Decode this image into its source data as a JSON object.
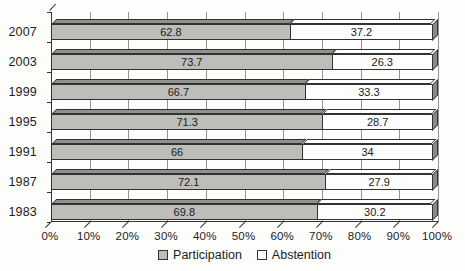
{
  "chart_data": {
    "type": "bar",
    "orientation": "horizontal",
    "stacked": true,
    "grid": "vertical",
    "legend_position": "bottom",
    "title": "",
    "xlabel": "",
    "ylabel": "",
    "xlim": [
      0,
      100
    ],
    "categories": [
      "2007",
      "2003",
      "1999",
      "1995",
      "1991",
      "1987",
      "1983"
    ],
    "series": [
      {
        "name": "Participation",
        "values": [
          62.8,
          73.7,
          66.7,
          71.3,
          66,
          72.1,
          69.8
        ],
        "labels": [
          "62.8",
          "73.7",
          "66.7",
          "71.3",
          "66",
          "72.1",
          "69.8"
        ],
        "color": "#bdbeba",
        "top_face_color": "#90918d"
      },
      {
        "name": "Abstention",
        "values": [
          37.2,
          26.3,
          33.3,
          28.7,
          34,
          27.9,
          30.2
        ],
        "labels": [
          "37.2",
          "26.3",
          "33.3",
          "28.7",
          "34",
          "27.9",
          "30.2"
        ],
        "color": "#fdfdfd",
        "top_face_color": "#fdfdfd"
      }
    ],
    "x_ticks": [
      "0%",
      "10%",
      "20%",
      "30%",
      "40%",
      "50%",
      "60%",
      "70%",
      "80%",
      "90%",
      "100%"
    ]
  },
  "colors": {
    "end_cap": "#8a8a8a",
    "outline": "#323232",
    "gridline": "#949494",
    "background": "#fdfdfc",
    "text": "#1c1c1c"
  },
  "legend": {
    "participation_label": "Participation",
    "abstention_label": "Abstention"
  }
}
